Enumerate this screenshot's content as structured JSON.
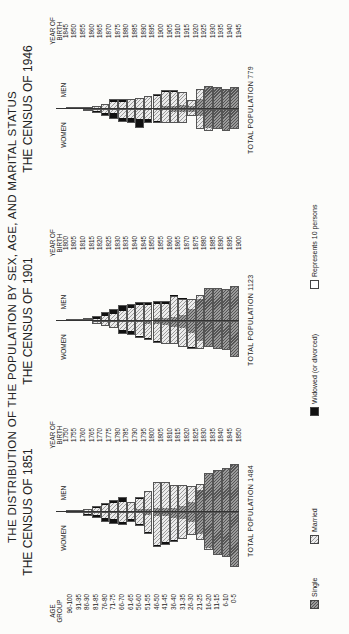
{
  "title": "THE DISTRIBUTION OF THE POPULATION BY SEX, AGE, AND MARITAL STATUS",
  "labels": {
    "age_group": "AGE GROUP",
    "year_of_birth": "YEAR OF BIRTH",
    "women": "WOMEN",
    "men": "MEN"
  },
  "legend": [
    {
      "key": "single",
      "label": "Single",
      "color": "#777777"
    },
    {
      "key": "married",
      "label": "Married",
      "color": "#dddddd"
    },
    {
      "key": "widowed",
      "label": "Widowed (or divorced)",
      "color": "#111111"
    },
    {
      "key": "unit",
      "label": "Represents 10 persons",
      "color": "#ffffff"
    }
  ],
  "chart_data": [
    {
      "type": "population_pyramid",
      "title": "THE CENSUS OF 1851",
      "total_label": "TOTAL POPULATION 1484",
      "total": 1484,
      "unit": "1 unit = 10 persons (approx.)",
      "age_groups": [
        "96-100",
        "91-95",
        "86-90",
        "81-85",
        "76-80",
        "71-75",
        "66-70",
        "61-65",
        "56-60",
        "51-55",
        "46-50",
        "41-45",
        "36-40",
        "31-35",
        "26-30",
        "21-25",
        "16-20",
        "11-15",
        "6-10",
        "0-5"
      ],
      "year_of_birth": [
        "1750",
        "1755",
        "1760",
        "1765",
        "1770",
        "1775",
        "1780",
        "1785",
        "1790",
        "1795",
        "1800",
        "1805",
        "1810",
        "1815",
        "1820",
        "1825",
        "1830",
        "1835",
        "1840",
        "1845",
        "1850"
      ],
      "men": {
        "single": [
          0,
          0,
          0.5,
          1,
          1,
          1,
          1,
          1,
          2,
          2,
          3,
          3,
          3,
          4,
          7,
          15,
          26,
          29,
          30,
          33
        ],
        "married": [
          0,
          0.3,
          1,
          2,
          4,
          5,
          6,
          5,
          7,
          12,
          17,
          17,
          15,
          14,
          11,
          4,
          1,
          0,
          0,
          0
        ],
        "widowed": [
          0.5,
          0.5,
          0.5,
          1,
          1,
          2,
          3,
          1,
          1,
          0.5,
          1,
          1,
          0.5,
          0.5,
          0,
          0,
          0,
          0,
          0,
          0
        ]
      },
      "women": {
        "single": [
          0,
          0,
          0.5,
          1,
          1,
          1,
          1,
          1,
          1,
          2,
          3,
          3,
          4,
          5,
          7,
          15,
          25,
          30,
          31,
          38
        ],
        "married": [
          0,
          0.2,
          1,
          1,
          3,
          4,
          6,
          4,
          7,
          12,
          20,
          18,
          15,
          13,
          9,
          4,
          1,
          0,
          0,
          0
        ],
        "widowed": [
          0.5,
          0.5,
          1,
          2,
          3,
          3,
          2,
          2,
          2,
          1,
          1,
          1.5,
          1.5,
          0.5,
          0,
          0.3,
          0,
          0,
          0,
          0
        ]
      },
      "xlabel": "",
      "ylabel": "AGE GROUP"
    },
    {
      "type": "population_pyramid",
      "title": "THE CENSUS OF 1901",
      "total_label": "TOTAL POPULATION 1123",
      "total": 1123,
      "age_groups": [
        "96-100",
        "91-95",
        "86-90",
        "81-85",
        "76-80",
        "71-75",
        "66-70",
        "61-65",
        "56-60",
        "51-55",
        "46-50",
        "41-45",
        "36-40",
        "31-35",
        "26-30",
        "21-25",
        "16-20",
        "11-15",
        "6-10",
        "0-5"
      ],
      "year_of_birth": [
        "1800",
        "1805",
        "1810",
        "1815",
        "1820",
        "1825",
        "1830",
        "1835",
        "1840",
        "1845",
        "1850",
        "1855",
        "1860",
        "1865",
        "1870",
        "1875",
        "1880",
        "1885",
        "1890",
        "1895",
        "1900"
      ],
      "men": {
        "single": [
          0,
          0,
          0,
          0.5,
          0.5,
          1,
          1,
          1,
          1,
          1,
          2,
          2,
          3,
          4,
          8,
          15,
          22,
          23,
          22,
          24
        ],
        "married": [
          0,
          0,
          0.3,
          1,
          3,
          4,
          6,
          8,
          10,
          10,
          10,
          10,
          14,
          11,
          7,
          3,
          1,
          0,
          0,
          0
        ],
        "widowed": [
          0.3,
          1,
          1.5,
          2,
          3,
          3,
          4,
          3,
          2,
          2,
          2,
          2,
          0.5,
          0.5,
          0,
          0,
          0,
          0,
          0,
          0
        ]
      },
      "women": {
        "single": [
          0,
          0,
          0,
          0.5,
          0.5,
          1,
          1,
          1,
          1,
          2,
          2,
          3,
          4,
          5,
          8,
          14,
          17,
          19,
          20,
          25
        ],
        "married": [
          0,
          0,
          0.2,
          1,
          2,
          3,
          5,
          6,
          9,
          10,
          12,
          12,
          11,
          12,
          10,
          5,
          1,
          0,
          0,
          0
        ],
        "widowed": [
          0,
          0,
          0,
          0.5,
          1,
          1,
          3,
          3,
          2,
          1,
          1,
          1,
          1,
          1,
          1,
          0,
          0,
          0,
          0,
          0
        ]
      },
      "xlabel": "",
      "ylabel": "AGE GROUP"
    },
    {
      "type": "population_pyramid",
      "title": "THE CENSUS OF 1946",
      "total_label": "TOTAL POPULATION 779",
      "total": 779,
      "age_groups": [
        "96-100",
        "91-95",
        "86-90",
        "81-85",
        "76-80",
        "71-75",
        "66-70",
        "61-65",
        "56-60",
        "51-55",
        "46-50",
        "41-45",
        "36-40",
        "31-35",
        "26-30",
        "21-25",
        "16-20",
        "11-15",
        "6-10",
        "0-5"
      ],
      "year_of_birth": [
        "1845",
        "1850",
        "1855",
        "1860",
        "1865",
        "1870",
        "1875",
        "1880",
        "1885",
        "1890",
        "1895",
        "1900",
        "1905",
        "1910",
        "1915",
        "1920",
        "1925",
        "1930",
        "1935",
        "1940",
        "1945"
      ],
      "men": {
        "single": [
          0,
          0,
          0,
          0.3,
          0.5,
          1,
          1,
          1,
          1,
          1,
          1,
          2,
          2,
          3,
          2,
          7,
          15,
          15,
          14,
          15
        ],
        "married": [
          0,
          0,
          0.3,
          1,
          2,
          4,
          4,
          5,
          6,
          7,
          8,
          10,
          10,
          8,
          4,
          6,
          1,
          0,
          0,
          0
        ],
        "widowed": [
          0.2,
          0.4,
          0.3,
          0.5,
          1,
          2,
          2,
          1,
          0.5,
          1,
          1,
          1,
          1,
          1,
          0,
          0.5,
          0,
          0,
          0,
          0
        ]
      },
      "women": {
        "single": [
          0,
          0,
          0.3,
          0.5,
          0.5,
          1,
          1,
          1,
          1,
          1,
          1,
          1,
          2,
          2,
          2,
          5,
          13,
          14,
          15,
          14
        ],
        "married": [
          0,
          0,
          0.5,
          1,
          2,
          2,
          5,
          5,
          6,
          6,
          7,
          8,
          7,
          7,
          3,
          8,
          2,
          0,
          0,
          0
        ],
        "widowed": [
          0,
          0.3,
          0.5,
          1,
          2,
          4,
          3,
          4,
          6,
          3,
          2,
          1,
          1,
          1,
          0,
          0.5,
          0.5,
          0,
          0,
          0
        ]
      },
      "xlabel": "",
      "ylabel": "AGE GROUP"
    }
  ]
}
